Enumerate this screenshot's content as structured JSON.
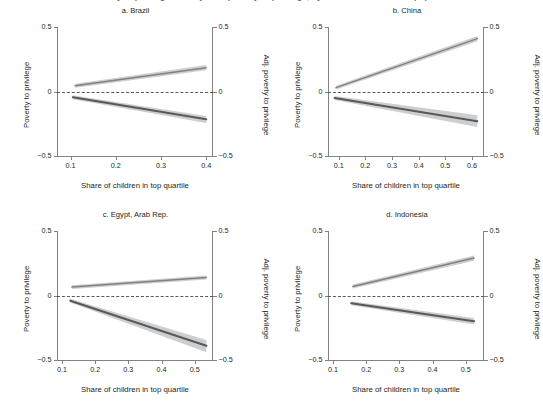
{
  "figure": {
    "title_fragment": "Poverty to privilege and adjusted poverty to privilege, by share of children in top quartile",
    "axis_x_label": "Share of children in top quartile",
    "axis_y_left_label": "Poverty to privilege",
    "axis_y_right_label": "Adj. poverty to privilege",
    "colors": {
      "upper_line": "#808285",
      "lower_line": "#58595b",
      "band": "#bcbec0",
      "axis": "#808285",
      "zero_line": "#58595b",
      "text": "#231f20"
    }
  },
  "chart_data": [
    {
      "type": "line",
      "title": "a. Brazil",
      "xlabel": "Share of children in top quartile",
      "ylabel": "Poverty to privilege",
      "ylabel_right": "Adj. poverty to privilege",
      "xlim": [
        0.07,
        0.415
      ],
      "ylim": [
        -0.5,
        0.5
      ],
      "xticks": [
        0.1,
        0.2,
        0.3,
        0.4
      ],
      "xtick_labels": [
        "0.1",
        "0.2",
        "0.3",
        "0.4"
      ],
      "yticks": [
        -0.5,
        0,
        0.5
      ],
      "ytick_labels": [
        "−0.5",
        "0",
        "0.5"
      ],
      "grid": false,
      "zero_reference_line": 0,
      "series": [
        {
          "name": "Adj. poverty to privilege",
          "x": [
            0.11,
            0.4
          ],
          "values": [
            0.045,
            0.185
          ],
          "ci_lower": [
            0.03,
            0.165
          ],
          "ci_upper": [
            0.06,
            0.205
          ]
        },
        {
          "name": "Poverty to privilege",
          "x": [
            0.105,
            0.4
          ],
          "values": [
            -0.045,
            -0.215
          ],
          "ci_lower": [
            -0.06,
            -0.245
          ],
          "ci_upper": [
            -0.03,
            -0.19
          ]
        }
      ]
    },
    {
      "type": "line",
      "title": "b. China",
      "xlabel": "Share of children in top quartile",
      "ylabel": "Poverty to privilege",
      "ylabel_right": "Adj. poverty to privilege",
      "xlim": [
        0.06,
        0.645
      ],
      "ylim": [
        -0.5,
        0.5
      ],
      "xticks": [
        0.1,
        0.2,
        0.3,
        0.4,
        0.5,
        0.6
      ],
      "xtick_labels": [
        "0.1",
        "0.2",
        "0.3",
        "0.4",
        "0.5",
        "0.6"
      ],
      "yticks": [
        -0.5,
        0,
        0.5
      ],
      "ytick_labels": [
        "−0.5",
        "0",
        "0.5"
      ],
      "grid": false,
      "zero_reference_line": 0,
      "series": [
        {
          "name": "Adj. poverty to privilege",
          "x": [
            0.09,
            0.62
          ],
          "values": [
            0.03,
            0.41
          ],
          "ci_lower": [
            0.015,
            0.39
          ],
          "ci_upper": [
            0.045,
            0.43
          ]
        },
        {
          "name": "Poverty to privilege",
          "x": [
            0.085,
            0.62
          ],
          "values": [
            -0.05,
            -0.23
          ],
          "ci_lower": [
            -0.065,
            -0.275
          ],
          "ci_upper": [
            -0.035,
            -0.185
          ]
        }
      ]
    },
    {
      "type": "line",
      "title": "c. Egypt, Arab Rep.",
      "xlabel": "Share of children in top quartile",
      "ylabel": "Poverty to privilege",
      "ylabel_right": "Adj. poverty to privilege",
      "xlim": [
        0.085,
        0.555
      ],
      "ylim": [
        -0.5,
        0.5
      ],
      "xticks": [
        0.1,
        0.2,
        0.3,
        0.4,
        0.5
      ],
      "xtick_labels": [
        "0.1",
        "0.2",
        "0.3",
        "0.4",
        "0.5"
      ],
      "yticks": [
        -0.5,
        0,
        0.5
      ],
      "ytick_labels": [
        "−0.5",
        "0",
        "0.5"
      ],
      "grid": false,
      "zero_reference_line": 0,
      "series": [
        {
          "name": "Adj. poverty to privilege",
          "x": [
            0.13,
            0.535
          ],
          "values": [
            0.065,
            0.14
          ],
          "ci_lower": [
            0.05,
            0.125
          ],
          "ci_upper": [
            0.08,
            0.155
          ]
        },
        {
          "name": "Poverty to privilege",
          "x": [
            0.125,
            0.535
          ],
          "values": [
            -0.04,
            -0.39
          ],
          "ci_lower": [
            -0.055,
            -0.44
          ],
          "ci_upper": [
            -0.025,
            -0.345
          ]
        }
      ]
    },
    {
      "type": "line",
      "title": "d. Indonesia",
      "xlabel": "Share of children in top quartile",
      "ylabel": "Poverty to privilege",
      "ylabel_right": "Adj. poverty to privilege",
      "xlim": [
        0.085,
        0.555
      ],
      "ylim": [
        -0.5,
        0.5
      ],
      "xticks": [
        0.1,
        0.2,
        0.3,
        0.4,
        0.5
      ],
      "xtick_labels": [
        "0.1",
        "0.2",
        "0.3",
        "0.4",
        "0.5"
      ],
      "yticks": [
        -0.5,
        0,
        0.5
      ],
      "ytick_labels": [
        "−0.5",
        "0",
        "0.5"
      ],
      "grid": false,
      "zero_reference_line": 0,
      "series": [
        {
          "name": "Adj. poverty to privilege",
          "x": [
            0.16,
            0.525
          ],
          "values": [
            0.07,
            0.29
          ],
          "ci_lower": [
            0.055,
            0.27
          ],
          "ci_upper": [
            0.085,
            0.31
          ]
        },
        {
          "name": "Poverty to privilege",
          "x": [
            0.155,
            0.525
          ],
          "values": [
            -0.06,
            -0.2
          ],
          "ci_lower": [
            -0.075,
            -0.225
          ],
          "ci_upper": [
            -0.045,
            -0.175
          ]
        }
      ]
    }
  ]
}
